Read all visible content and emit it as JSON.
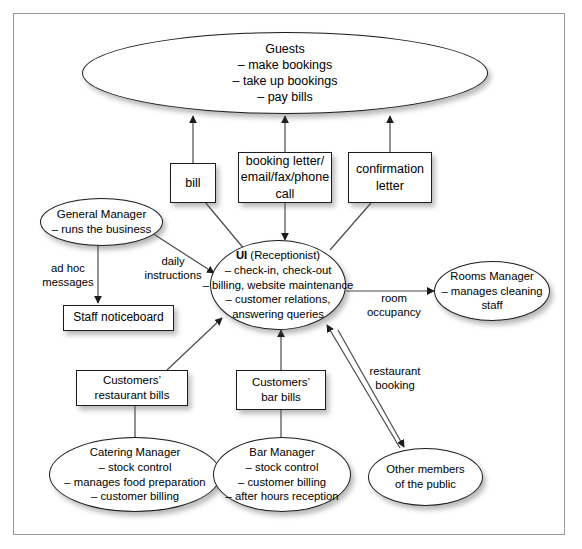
{
  "diagram": {
    "type": "rich-picture",
    "colors": {
      "stroke": "#1c1c1c",
      "frame": "#9a9a9a",
      "background": "#ffffff",
      "text": "#000000"
    }
  },
  "nodes": {
    "guests": {
      "shape": "ellipse",
      "lines": [
        "Guests",
        "– make bookings",
        "– take up bookings",
        "– pay bills"
      ]
    },
    "bill": {
      "shape": "box",
      "lines": [
        "bill"
      ]
    },
    "booking_letter": {
      "shape": "box",
      "lines": [
        "booking letter/",
        "email/fax/phone",
        "call"
      ]
    },
    "confirmation_letter": {
      "shape": "box",
      "lines": [
        "confirmation",
        "letter"
      ]
    },
    "general_manager": {
      "shape": "ellipse",
      "lines": [
        "General Manager",
        "– runs the business"
      ]
    },
    "staff_noticeboard": {
      "shape": "box",
      "lines": [
        "Staff noticeboard"
      ]
    },
    "ui_receptionist": {
      "shape": "ellipse",
      "title_bold": "UI",
      "title_rest": " (Receptionist)",
      "lines": [
        "– check-in, check-out",
        "– billing, website maintenance",
        "– customer relations,",
        "answering queries"
      ]
    },
    "rooms_manager": {
      "shape": "ellipse",
      "lines": [
        "Rooms Manager",
        "– manages cleaning",
        "staff"
      ]
    },
    "customers_restaurant_bills": {
      "shape": "box",
      "lines": [
        "Customers’",
        "restaurant bills"
      ]
    },
    "customers_bar_bills": {
      "shape": "box",
      "lines": [
        "Customers’",
        "bar bills"
      ]
    },
    "catering_manager": {
      "shape": "ellipse",
      "lines": [
        "Catering Manager",
        "– stock control",
        "– manages food preparation",
        "– customer billing"
      ]
    },
    "bar_manager": {
      "shape": "ellipse",
      "lines": [
        "Bar Manager",
        "– stock control",
        "– customer billing",
        "– after hours reception"
      ]
    },
    "other_public": {
      "shape": "ellipse",
      "lines": [
        "Other members",
        "of the public"
      ]
    }
  },
  "edge_labels": {
    "ad_hoc_messages": "ad hoc\nmessages",
    "daily_instructions": "daily\ninstructions",
    "room_occupancy": "room\noccupancy",
    "restaurant_booking": "restaurant\nbooking"
  }
}
